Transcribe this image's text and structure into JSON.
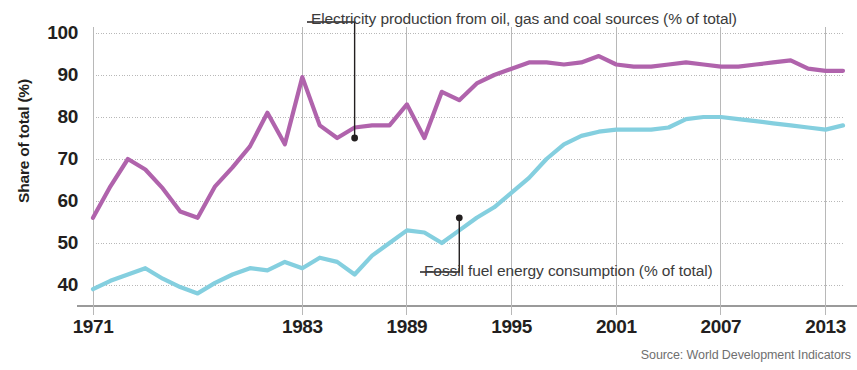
{
  "axis": {
    "ylabel": "Share of total (%)",
    "yticks": [
      100,
      90,
      80,
      70,
      60,
      50,
      40
    ],
    "xticks": [
      "1971",
      "1983",
      "1989",
      "1995",
      "2001",
      "2007",
      "2013"
    ]
  },
  "annotations": {
    "series1": "Electricity production from oil, gas and coal sources (% of total)",
    "series2": "Fossil fuel energy consumption (% of total)"
  },
  "source": "Source: World Development Indicators",
  "colors": {
    "series1": "#b063ac",
    "series2": "#84cfdf",
    "grid": "#b8b8b8",
    "axis_text": "#231f20",
    "anno_text": "#3b3b3b",
    "source_text": "#6f6f6f"
  },
  "chart_data": {
    "type": "line",
    "title": "",
    "xlabel": "",
    "ylabel": "Share of total (%)",
    "xlim": [
      1971,
      2014
    ],
    "ylim": [
      35,
      100
    ],
    "grid": true,
    "legend": "annotated callouts",
    "x": [
      1971,
      1972,
      1973,
      1974,
      1975,
      1976,
      1977,
      1978,
      1979,
      1980,
      1981,
      1982,
      1983,
      1984,
      1985,
      1986,
      1987,
      1988,
      1989,
      1990,
      1991,
      1992,
      1993,
      1994,
      1995,
      1996,
      1997,
      1998,
      1999,
      2000,
      2001,
      2002,
      2003,
      2004,
      2005,
      2006,
      2007,
      2008,
      2009,
      2010,
      2011,
      2012,
      2013,
      2014
    ],
    "series": [
      {
        "name": "Electricity production from oil, gas and coal sources (% of total)",
        "color": "#b063ac",
        "values": [
          56.0,
          63.5,
          70.0,
          67.5,
          63.0,
          57.5,
          56.0,
          63.5,
          68.0,
          73.0,
          81.0,
          73.5,
          89.5,
          78.0,
          75.0,
          77.5,
          78.0,
          78.0,
          83.0,
          75.0,
          86.0,
          84.0,
          88.0,
          90.0,
          91.5,
          93.0,
          93.0,
          92.5,
          93.0,
          94.5,
          92.5,
          92.0,
          92.0,
          92.5,
          93.0,
          92.5,
          92.0,
          92.0,
          92.5,
          93.0,
          93.5,
          91.5,
          91.0,
          91.0
        ],
        "callout": {
          "x": 1986,
          "y": 75.0
        }
      },
      {
        "name": "Fossil fuel energy consumption (% of total)",
        "color": "#84cfdf",
        "values": [
          39.0,
          41.0,
          42.5,
          44.0,
          41.5,
          39.5,
          38.0,
          40.5,
          42.5,
          44.0,
          43.5,
          45.5,
          44.0,
          46.5,
          45.5,
          42.5,
          47.0,
          50.0,
          53.0,
          52.5,
          50.0,
          53.0,
          56.0,
          58.5,
          62.0,
          65.5,
          70.0,
          73.5,
          75.5,
          76.5,
          77.0,
          77.0,
          77.0,
          77.5,
          79.5,
          80.0,
          80.0,
          79.5,
          79.0,
          78.5,
          78.0,
          77.5,
          77.0,
          78.0
        ],
        "callout": {
          "x": 1992,
          "y": 56.0
        }
      }
    ]
  }
}
